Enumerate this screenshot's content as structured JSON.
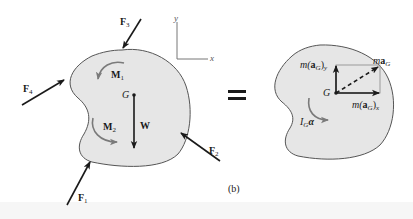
{
  "figure": {
    "caption": "(b)",
    "equals_sign": "=",
    "colors": {
      "body_fill": "#e6e6e6",
      "body_outline": "#555555",
      "force_arrow": "#1a1a1a",
      "moment_arrow": "#7a7a7a",
      "axis_line": "#777777",
      "background": "#ffffff"
    }
  },
  "free_body_diagram": {
    "forces": [
      {
        "id": "F1",
        "symbol": "F",
        "subscript": "1"
      },
      {
        "id": "F2",
        "symbol": "F",
        "subscript": "2"
      },
      {
        "id": "F3",
        "symbol": "F",
        "subscript": "3"
      },
      {
        "id": "F4",
        "symbol": "F",
        "subscript": "4"
      }
    ],
    "moments": [
      {
        "id": "M1",
        "symbol": "M",
        "subscript": "1"
      },
      {
        "id": "M2",
        "symbol": "M",
        "subscript": "2"
      }
    ],
    "weight": {
      "symbol": "W"
    },
    "center_of_mass": {
      "label": "G"
    },
    "axes": {
      "x_label": "x",
      "y_label": "y"
    }
  },
  "kinetic_diagram": {
    "center_of_mass": {
      "label": "G"
    },
    "ma_G": {
      "prefix": "m",
      "vector": "a",
      "subscript": "G"
    },
    "ma_Gx": {
      "prefix": "m(",
      "vector": "a",
      "subscript": "G",
      "suffix": ")",
      "component": "x"
    },
    "ma_Gy": {
      "prefix": "m(",
      "vector": "a",
      "subscript": "G",
      "suffix": ")",
      "component": "y"
    },
    "I_G_alpha": {
      "symbol": "I",
      "subscript": "G",
      "alpha": "α"
    }
  }
}
